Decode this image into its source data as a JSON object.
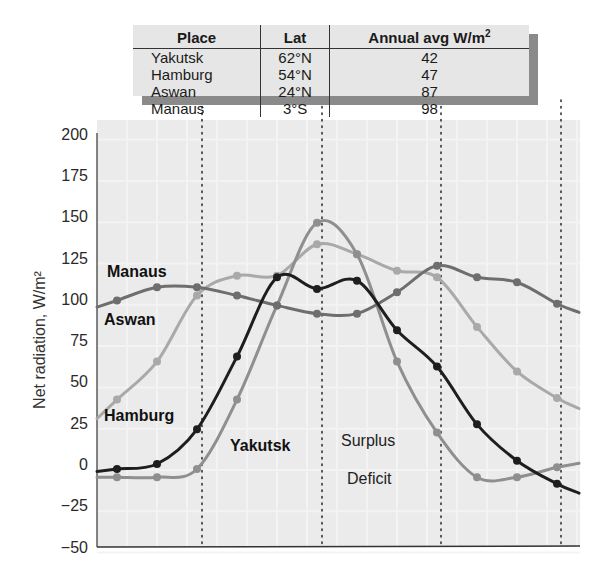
{
  "table": {
    "headers": {
      "place": "Place",
      "lat": "Lat",
      "annual": "Annual avg W/m",
      "annual_sup": "2"
    },
    "rows": [
      {
        "place": "Yakutsk",
        "lat": "62°N",
        "annual": "42"
      },
      {
        "place": "Hamburg",
        "lat": "54°N",
        "annual": "47"
      },
      {
        "place": "Aswan",
        "lat": "24°N",
        "annual": "87"
      },
      {
        "place": "Manaus",
        "lat": "3°S",
        "annual": "98"
      }
    ]
  },
  "labels": {
    "y_axis_title": "Net radiation, W/m²",
    "surplus": "Surplus",
    "deficit": "Deficit",
    "manaus": "Manaus",
    "aswan": "Aswan",
    "hamburg": "Hamburg",
    "yakutsk": "Yakutsk"
  },
  "colors": {
    "manaus": "#6e6e6e",
    "aswan": "#a9a9a9",
    "hamburg": "#1e1e1e",
    "yakutsk": "#8f8f8f",
    "grid": "#f3f3f3",
    "plot_bg": "#ebebeb"
  },
  "chart_data": {
    "type": "line",
    "title": "",
    "xlabel": "",
    "ylabel": "Net radiation, W/m²",
    "ylim": [
      -50,
      200
    ],
    "yticks": [
      200,
      175,
      150,
      125,
      100,
      75,
      50,
      25,
      0,
      -25,
      -50
    ],
    "x": [
      1,
      2,
      3,
      4,
      5,
      6,
      7,
      8,
      9,
      10,
      11,
      12
    ],
    "grid": true,
    "series": [
      {
        "name": "Manaus",
        "values": [
          99,
          107,
          107,
          102,
          96,
          91,
          91,
          104,
          120,
          113,
          110,
          97
        ]
      },
      {
        "name": "Aswan",
        "values": [
          39,
          62,
          102,
          114,
          114,
          133,
          127,
          117,
          113,
          83,
          56,
          40
        ]
      },
      {
        "name": "Hamburg",
        "values": [
          -3,
          0,
          21,
          65,
          113,
          106,
          111,
          81,
          59,
          24,
          2,
          -12
        ]
      },
      {
        "name": "Yakutsk",
        "values": [
          -8,
          -8,
          -3,
          39,
          96,
          146,
          127,
          62,
          19,
          -8,
          -8,
          -2
        ]
      }
    ],
    "annotations": [
      "Surplus",
      "Deficit"
    ],
    "inset_table": {
      "columns": [
        "Place",
        "Lat",
        "Annual avg W/m²"
      ],
      "rows": [
        [
          "Yakutsk",
          "62°N",
          42
        ],
        [
          "Hamburg",
          "54°N",
          47
        ],
        [
          "Aswan",
          "24°N",
          87
        ],
        [
          "Manaus",
          "3°S",
          98
        ]
      ]
    }
  }
}
